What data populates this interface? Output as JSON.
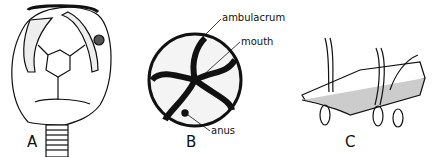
{
  "figure": {
    "panels": [
      {
        "id": "A",
        "label": "A",
        "subject": "cystoid-like echinoderm theca on stem"
      },
      {
        "id": "B",
        "label": "B",
        "subject": "edrioasteroid oral view",
        "annotations": [
          "ambulacrum",
          "mouth",
          "anus"
        ]
      },
      {
        "id": "C",
        "label": "C",
        "subject": "tube feet through ambulacral plates"
      }
    ]
  }
}
